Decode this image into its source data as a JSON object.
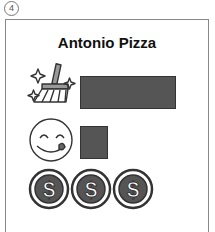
{
  "figure_number": "4",
  "card": {
    "title": "Antonio Pizza",
    "rows": [
      {
        "icon": "broom-sparkle-icon",
        "label": "cleanliness",
        "bar_width": 96,
        "bar_color": "#555555"
      },
      {
        "icon": "yummy-face-icon",
        "label": "taste",
        "bar_width": 28,
        "bar_color": "#555555"
      },
      {
        "icon": "dollar-coin-icon",
        "label": "price",
        "count": 3
      }
    ]
  }
}
